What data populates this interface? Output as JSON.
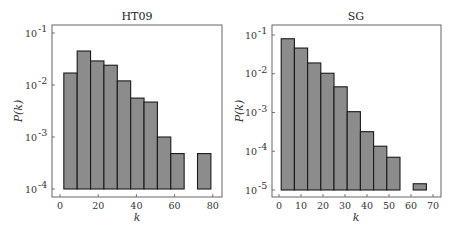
{
  "chart_data": [
    {
      "type": "bar",
      "title": "HT09",
      "xlabel": "k",
      "ylabel": "P(k)",
      "yscale": "log",
      "ylim": [
        0.0001,
        0.1
      ],
      "xlim": [
        -3,
        83
      ],
      "xticks": [
        0,
        20,
        40,
        60,
        80
      ],
      "ytick_labels": [
        "10^-1",
        "10^-2",
        "10^-3",
        "10^-4"
      ],
      "bin_width": 7,
      "bin_edges": [
        2,
        9,
        16,
        23,
        30,
        37,
        44,
        51,
        58,
        65,
        72,
        79
      ],
      "values": [
        0.017,
        0.045,
        0.029,
        0.024,
        0.012,
        0.0056,
        0.0047,
        0.001,
        0.00048,
        0,
        0.00048
      ],
      "grid": false,
      "legend": null
    },
    {
      "type": "bar",
      "title": "SG",
      "xlabel": "k",
      "ylabel": "P(k)",
      "yscale": "log",
      "ylim": [
        1e-05,
        0.1
      ],
      "xlim": [
        -3,
        74
      ],
      "xticks": [
        0,
        10,
        20,
        30,
        40,
        50,
        60,
        70
      ],
      "ytick_labels": [
        "10^-1",
        "10^-2",
        "10^-3",
        "10^-4",
        "10^-5"
      ],
      "bin_width": 6,
      "bin_edges": [
        1,
        7,
        13,
        19,
        25,
        31,
        37,
        43,
        49,
        55,
        61,
        67
      ],
      "values": [
        0.08,
        0.046,
        0.019,
        0.0103,
        0.0046,
        0.00105,
        0.00032,
        0.000135,
        7e-05,
        0,
        1.45e-05
      ],
      "grid": false,
      "legend": null
    }
  ],
  "panels": [
    {
      "title": "HT09",
      "xlabel": "k",
      "ylabel": "P(k)",
      "xtick_labels": [
        "0",
        "20",
        "40",
        "60",
        "80"
      ],
      "ytick_mantissa": [
        "10",
        "10",
        "10",
        "10"
      ],
      "ytick_exponents": [
        "-1",
        "-2",
        "-3",
        "-4"
      ]
    },
    {
      "title": "SG",
      "xlabel": "k",
      "ylabel": "P(k)",
      "xtick_labels": [
        "0",
        "10",
        "20",
        "30",
        "40",
        "50",
        "60",
        "70"
      ],
      "ytick_mantissa": [
        "10",
        "10",
        "10",
        "10",
        "10"
      ],
      "ytick_exponents": [
        "-1",
        "-2",
        "-3",
        "-4",
        "-5"
      ]
    }
  ],
  "colors": {
    "bar_fill": "#8c8c8c",
    "bar_edge": "#1a1a1a",
    "frame": "#555555"
  }
}
